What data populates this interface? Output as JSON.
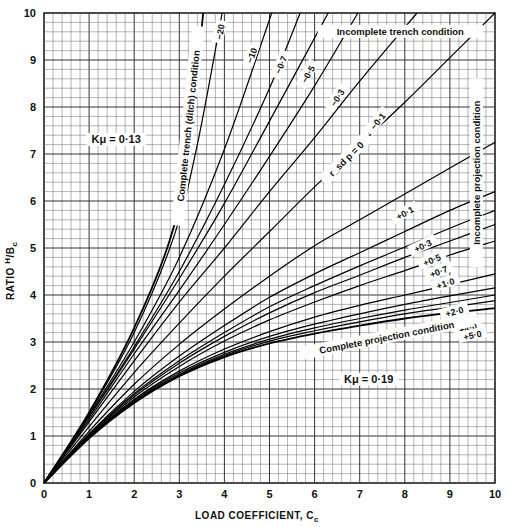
{
  "chart_data": {
    "type": "line",
    "title": "",
    "xlabel": "LOAD COEFFICIENT, Cc",
    "ylabel": "RATIO H/Bc",
    "xlim": [
      0,
      10
    ],
    "ylim": [
      0,
      10
    ],
    "grid": true,
    "x_ticks": [
      "0",
      "1",
      "2",
      "3",
      "4",
      "5",
      "6",
      "7",
      "8",
      "9",
      "10"
    ],
    "y_ticks": [
      "0",
      "1",
      "2",
      "3",
      "4",
      "5",
      "6",
      "7",
      "8",
      "9",
      "10"
    ],
    "annotations": [
      {
        "text": "Kμ = 0·13",
        "x": 1.6,
        "y": 7.3
      },
      {
        "text": "Kμ = 0·19",
        "x": 7.2,
        "y": 2.2
      },
      {
        "text": "Complete trench (ditch) condition",
        "x": 3.2,
        "y": 7.6,
        "rotate": -84
      },
      {
        "text": "Incomplete trench condition",
        "x": 7.9,
        "y": 9.6
      },
      {
        "text": "Incomplete projection condition",
        "x": 9.6,
        "y": 6.6,
        "rotate": -90
      },
      {
        "text": "Complete projection condition",
        "x": 7.6,
        "y": 3.1,
        "rotate": -11
      },
      {
        "text": "r_sd p = 0",
        "x": 6.7,
        "y": 6.9,
        "rotate": -45
      }
    ],
    "series": [
      {
        "name": "Complete trench (ditch) condition",
        "label": "",
        "points": [
          [
            0,
            0
          ],
          [
            1,
            1.5
          ],
          [
            2,
            3.3
          ],
          [
            2.8,
            5.2
          ],
          [
            3.2,
            7.0
          ],
          [
            3.53,
            10
          ]
        ]
      },
      {
        "name": "-20",
        "label": "−20",
        "label_at": [
          3.9,
          9.6
        ],
        "points": [
          [
            0,
            0
          ],
          [
            1,
            1.48
          ],
          [
            2,
            3.2
          ],
          [
            2.9,
            5.3
          ],
          [
            3.4,
            7.2
          ],
          [
            3.95,
            10
          ]
        ]
      },
      {
        "name": "-10",
        "label": "−10",
        "label_at": [
          4.6,
          9.1
        ],
        "points": [
          [
            0,
            0
          ],
          [
            1,
            1.45
          ],
          [
            2,
            3.0
          ],
          [
            3,
            4.8
          ],
          [
            4,
            7.1
          ],
          [
            5.05,
            10
          ]
        ]
      },
      {
        "name": "-0.7",
        "label": "−0·7",
        "label_at": [
          5.25,
          8.9
        ],
        "points": [
          [
            0,
            0
          ],
          [
            1,
            1.42
          ],
          [
            2,
            2.9
          ],
          [
            3,
            4.5
          ],
          [
            4,
            6.35
          ],
          [
            5,
            8.4
          ],
          [
            5.68,
            10
          ]
        ]
      },
      {
        "name": "-0.5",
        "label": "−0·5",
        "label_at": [
          5.85,
          8.7
        ],
        "points": [
          [
            0,
            0
          ],
          [
            1,
            1.4
          ],
          [
            2,
            2.85
          ],
          [
            3,
            4.35
          ],
          [
            4,
            5.95
          ],
          [
            5,
            7.7
          ],
          [
            6.3,
            10
          ]
        ]
      },
      {
        "name": "-0.3",
        "label": "−0·3",
        "label_at": [
          6.5,
          8.2
        ],
        "points": [
          [
            0,
            0
          ],
          [
            1,
            1.35
          ],
          [
            2,
            2.75
          ],
          [
            3,
            4.1
          ],
          [
            4,
            5.5
          ],
          [
            5,
            6.95
          ],
          [
            6,
            8.45
          ],
          [
            6.96,
            10
          ]
        ]
      },
      {
        "name": "-0.1",
        "label": "−0·1",
        "label_at": [
          7.4,
          7.7
        ],
        "points": [
          [
            0,
            0
          ],
          [
            1,
            1.3
          ],
          [
            2,
            2.6
          ],
          [
            3,
            3.85
          ],
          [
            4,
            5.0
          ],
          [
            5,
            6.2
          ],
          [
            6,
            7.35
          ],
          [
            7,
            8.55
          ],
          [
            8.27,
            10
          ]
        ]
      },
      {
        "name": "r_sd p = 0",
        "label": "",
        "points": [
          [
            0,
            0
          ],
          [
            1,
            1.2
          ],
          [
            2,
            2.35
          ],
          [
            3,
            3.4
          ],
          [
            4,
            4.4
          ],
          [
            5,
            5.35
          ],
          [
            6,
            6.3
          ],
          [
            7,
            7.2
          ],
          [
            8,
            8.1
          ],
          [
            9,
            9.05
          ],
          [
            10,
            10
          ]
        ]
      },
      {
        "name": "+0.1",
        "label": "+0·1",
        "label_at": [
          8.0,
          5.75
        ],
        "points": [
          [
            0,
            0
          ],
          [
            1,
            1.1
          ],
          [
            2,
            2.1
          ],
          [
            3,
            2.95
          ],
          [
            4,
            3.7
          ],
          [
            5,
            4.4
          ],
          [
            6,
            5.05
          ],
          [
            7,
            5.6
          ],
          [
            8,
            6.15
          ],
          [
            9,
            6.7
          ],
          [
            10,
            7.25
          ]
        ]
      },
      {
        "name": "+0.3",
        "label": "+0·3",
        "label_at": [
          8.4,
          5.05
        ],
        "points": [
          [
            0,
            0
          ],
          [
            1,
            1.05
          ],
          [
            2,
            1.95
          ],
          [
            3,
            2.7
          ],
          [
            4,
            3.35
          ],
          [
            5,
            3.95
          ],
          [
            6,
            4.45
          ],
          [
            7,
            4.9
          ],
          [
            8,
            5.35
          ],
          [
            9,
            5.8
          ],
          [
            10,
            6.2
          ]
        ]
      },
      {
        "name": "+0.5",
        "label": "+0·5",
        "label_at": [
          8.6,
          4.75
        ],
        "points": [
          [
            0,
            0
          ],
          [
            1,
            1.03
          ],
          [
            2,
            1.9
          ],
          [
            3,
            2.6
          ],
          [
            4,
            3.2
          ],
          [
            5,
            3.75
          ],
          [
            6,
            4.2
          ],
          [
            7,
            4.62
          ],
          [
            8,
            5.02
          ],
          [
            9,
            5.42
          ],
          [
            10,
            5.8
          ]
        ]
      },
      {
        "name": "+0.7",
        "label": "+0·7",
        "label_at": [
          8.75,
          4.5
        ],
        "points": [
          [
            0,
            0
          ],
          [
            1,
            1.02
          ],
          [
            2,
            1.87
          ],
          [
            3,
            2.55
          ],
          [
            4,
            3.12
          ],
          [
            5,
            3.62
          ],
          [
            6,
            4.05
          ],
          [
            7,
            4.42
          ],
          [
            8,
            4.8
          ],
          [
            9,
            5.15
          ],
          [
            10,
            5.5
          ]
        ]
      },
      {
        "name": "+1.0",
        "label": "+1·0",
        "label_at": [
          8.9,
          4.25
        ],
        "points": [
          [
            0,
            0
          ],
          [
            1,
            1.0
          ],
          [
            2,
            1.83
          ],
          [
            3,
            2.48
          ],
          [
            4,
            3.02
          ],
          [
            5,
            3.47
          ],
          [
            6,
            3.85
          ],
          [
            7,
            4.2
          ],
          [
            8,
            4.52
          ],
          [
            9,
            4.85
          ],
          [
            10,
            5.15
          ]
        ]
      },
      {
        "name": "+2.0",
        "label": "+2·0",
        "label_at": [
          9.1,
          3.65
        ],
        "points": [
          [
            0,
            0
          ],
          [
            1,
            0.98
          ],
          [
            2,
            1.78
          ],
          [
            3,
            2.38
          ],
          [
            4,
            2.85
          ],
          [
            5,
            3.22
          ],
          [
            6,
            3.53
          ],
          [
            7,
            3.78
          ],
          [
            8,
            4.0
          ],
          [
            9,
            4.22
          ],
          [
            10,
            4.45
          ]
        ]
      },
      {
        "name": "+3.0",
        "label": "+3·0",
        "label_at": [
          9.3,
          3.45
        ],
        "points": [
          [
            0,
            0
          ],
          [
            1,
            0.97
          ],
          [
            2,
            1.76
          ],
          [
            3,
            2.34
          ],
          [
            4,
            2.78
          ],
          [
            5,
            3.12
          ],
          [
            6,
            3.38
          ],
          [
            7,
            3.6
          ],
          [
            8,
            3.8
          ],
          [
            9,
            3.98
          ],
          [
            10,
            4.15
          ]
        ]
      },
      {
        "name": "+4.0",
        "label": "+4·0",
        "label_at": [
          9.4,
          3.3
        ],
        "points": [
          [
            0,
            0
          ],
          [
            1,
            0.96
          ],
          [
            2,
            1.74
          ],
          [
            3,
            2.31
          ],
          [
            4,
            2.74
          ],
          [
            5,
            3.06
          ],
          [
            6,
            3.3
          ],
          [
            7,
            3.5
          ],
          [
            8,
            3.68
          ],
          [
            9,
            3.84
          ],
          [
            10,
            4.0
          ]
        ]
      },
      {
        "name": "+5.0",
        "label": "+5·0",
        "label_at": [
          9.5,
          3.15
        ],
        "points": [
          [
            0,
            0
          ],
          [
            1,
            0.955
          ],
          [
            2,
            1.72
          ],
          [
            3,
            2.29
          ],
          [
            4,
            2.71
          ],
          [
            5,
            3.02
          ],
          [
            6,
            3.24
          ],
          [
            7,
            3.43
          ],
          [
            8,
            3.6
          ],
          [
            9,
            3.74
          ],
          [
            10,
            3.88
          ]
        ]
      },
      {
        "name": "Complete projection condition",
        "label": "",
        "points": [
          [
            0,
            0
          ],
          [
            1,
            0.95
          ],
          [
            2,
            1.7
          ],
          [
            3,
            2.27
          ],
          [
            4,
            2.68
          ],
          [
            5,
            2.97
          ],
          [
            6,
            3.18
          ],
          [
            7,
            3.35
          ],
          [
            8,
            3.5
          ],
          [
            9,
            3.62
          ],
          [
            10,
            3.72
          ]
        ]
      }
    ]
  }
}
